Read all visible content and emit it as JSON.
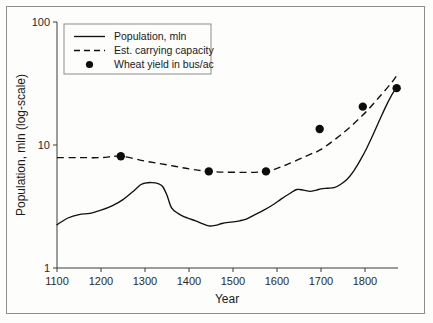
{
  "chart_data": {
    "type": "line",
    "title": "",
    "xlabel": "Year",
    "ylabel": "Population, mln (log-scale)",
    "yscale": "log",
    "xlim": [
      1100,
      1875
    ],
    "ylim": [
      1,
      100
    ],
    "grid": false,
    "xticks": [
      1100,
      1200,
      1300,
      1400,
      1500,
      1600,
      1700,
      1800
    ],
    "xtick_labels": [
      "1100",
      "1200",
      "1300",
      "1400",
      "1500",
      "1600",
      "1700",
      "1800"
    ],
    "yticks": [
      1,
      10,
      100
    ],
    "ytick_labels": [
      "1",
      "10",
      "100"
    ],
    "legend_position": "upper-left",
    "legend": [
      {
        "label": "Population, mln",
        "style": "solid-line"
      },
      {
        "label": "Est. carrying capacity",
        "style": "dashed-line"
      },
      {
        "label": "Wheat yield in bus/ac",
        "style": "dot-marker"
      }
    ],
    "series": [
      {
        "name": "Population, mln",
        "style": "solid-line",
        "x": [
          1100,
          1125,
          1150,
          1175,
          1200,
          1225,
          1250,
          1275,
          1290,
          1300,
          1315,
          1330,
          1340,
          1350,
          1360,
          1375,
          1390,
          1400,
          1415,
          1430,
          1445,
          1460,
          1475,
          1490,
          1500,
          1515,
          1530,
          1550,
          1570,
          1590,
          1610,
          1630,
          1645,
          1660,
          1675,
          1690,
          1700,
          1715,
          1730,
          1745,
          1760,
          1775,
          1790,
          1805,
          1820,
          1835,
          1850,
          1865,
          1875
        ],
        "y": [
          2.25,
          2.55,
          2.72,
          2.78,
          2.95,
          3.2,
          3.6,
          4.25,
          4.75,
          4.9,
          4.95,
          4.85,
          4.6,
          3.9,
          3.1,
          2.78,
          2.6,
          2.52,
          2.42,
          2.3,
          2.2,
          2.22,
          2.3,
          2.35,
          2.37,
          2.42,
          2.5,
          2.72,
          2.95,
          3.25,
          3.65,
          4.05,
          4.35,
          4.3,
          4.2,
          4.3,
          4.4,
          4.45,
          4.5,
          4.8,
          5.3,
          6.2,
          7.6,
          9.6,
          12.5,
          16.5,
          21.5,
          27.0,
          30.0
        ]
      },
      {
        "name": "Est. carrying capacity",
        "style": "dashed-line",
        "x": [
          1100,
          1150,
          1200,
          1245,
          1300,
          1350,
          1400,
          1445,
          1500,
          1575,
          1625,
          1675,
          1700,
          1750,
          1795,
          1830,
          1860,
          1875
        ],
        "y": [
          7.9,
          7.9,
          7.9,
          8.1,
          7.4,
          6.9,
          6.4,
          6.1,
          6.0,
          6.1,
          7.0,
          8.4,
          9.2,
          12.5,
          17.5,
          24.0,
          32.0,
          38.0
        ]
      },
      {
        "name": "Wheat yield in bus/ac",
        "style": "dot-marker",
        "x": [
          1245,
          1445,
          1575,
          1697,
          1795,
          1872
        ],
        "y": [
          8.1,
          6.1,
          6.1,
          13.5,
          20.5,
          29.0
        ]
      }
    ]
  },
  "axes": {
    "x_title": "Year",
    "y_title": "Population, mln (log-scale)"
  }
}
